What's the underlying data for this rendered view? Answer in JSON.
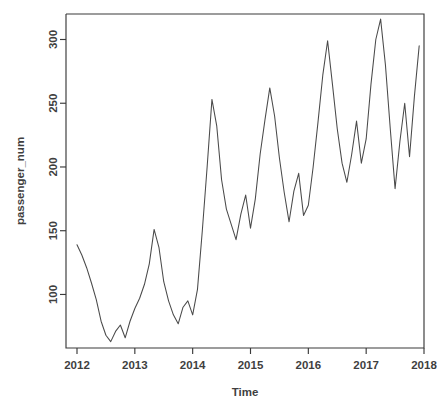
{
  "chart_data": {
    "type": "line",
    "title": "",
    "xlabel": "Time",
    "ylabel": "passenger_num",
    "xlim": [
      2012.0,
      2017.9167
    ],
    "ylim": [
      58,
      320
    ],
    "grid": false,
    "legend": "none",
    "x_ticks": [
      2012,
      2013,
      2014,
      2015,
      2016,
      2017,
      2018
    ],
    "x_tick_labels": [
      "2012",
      "2013",
      "2014",
      "2015",
      "2016",
      "2017",
      "2018"
    ],
    "y_ticks": [
      100,
      150,
      200,
      250,
      300
    ],
    "y_tick_labels": [
      "100",
      "150",
      "200",
      "250",
      "300"
    ],
    "series": [
      {
        "name": "passenger_num",
        "color": "#4a4a4a",
        "x": [
          2012.0,
          2012.0833,
          2012.1667,
          2012.25,
          2012.3333,
          2012.4167,
          2012.5,
          2012.5833,
          2012.6667,
          2012.75,
          2012.8333,
          2012.9167,
          2013.0,
          2013.0833,
          2013.1667,
          2013.25,
          2013.3333,
          2013.4167,
          2013.5,
          2013.5833,
          2013.6667,
          2013.75,
          2013.8333,
          2013.9167,
          2014.0,
          2014.0833,
          2014.1667,
          2014.25,
          2014.3333,
          2014.4167,
          2014.5,
          2014.5833,
          2014.6667,
          2014.75,
          2014.8333,
          2014.9167,
          2015.0,
          2015.0833,
          2015.1667,
          2015.25,
          2015.3333,
          2015.4167,
          2015.5,
          2015.5833,
          2015.6667,
          2015.75,
          2015.8333,
          2015.9167,
          2016.0,
          2016.0833,
          2016.1667,
          2016.25,
          2016.3333,
          2016.4167,
          2016.5,
          2016.5833,
          2016.6667,
          2016.75,
          2016.8333,
          2016.9167,
          2017.0,
          2017.0833,
          2017.1667,
          2017.25,
          2017.3333,
          2017.4167,
          2017.5,
          2017.5833,
          2017.6667,
          2017.75,
          2017.8333,
          2017.9167
        ],
        "values": [
          139,
          131,
          121,
          109,
          96,
          79,
          68,
          63,
          71,
          76,
          66,
          79,
          89,
          97,
          108,
          124,
          151,
          137,
          110,
          95,
          84,
          77,
          90,
          95,
          84,
          104,
          150,
          200,
          253,
          232,
          190,
          167,
          155,
          143,
          163,
          178,
          152,
          175,
          210,
          237,
          262,
          240,
          207,
          180,
          157,
          181,
          195,
          162,
          170,
          200,
          235,
          272,
          299,
          265,
          230,
          203,
          188,
          210,
          236,
          203,
          222,
          265,
          300,
          316,
          280,
          230,
          183,
          220,
          250,
          208,
          255,
          295
        ]
      }
    ]
  },
  "plot": {
    "background_color": "#ffffff",
    "axis_color": "#3a3a3a",
    "line_color": "#4a4a4a"
  }
}
